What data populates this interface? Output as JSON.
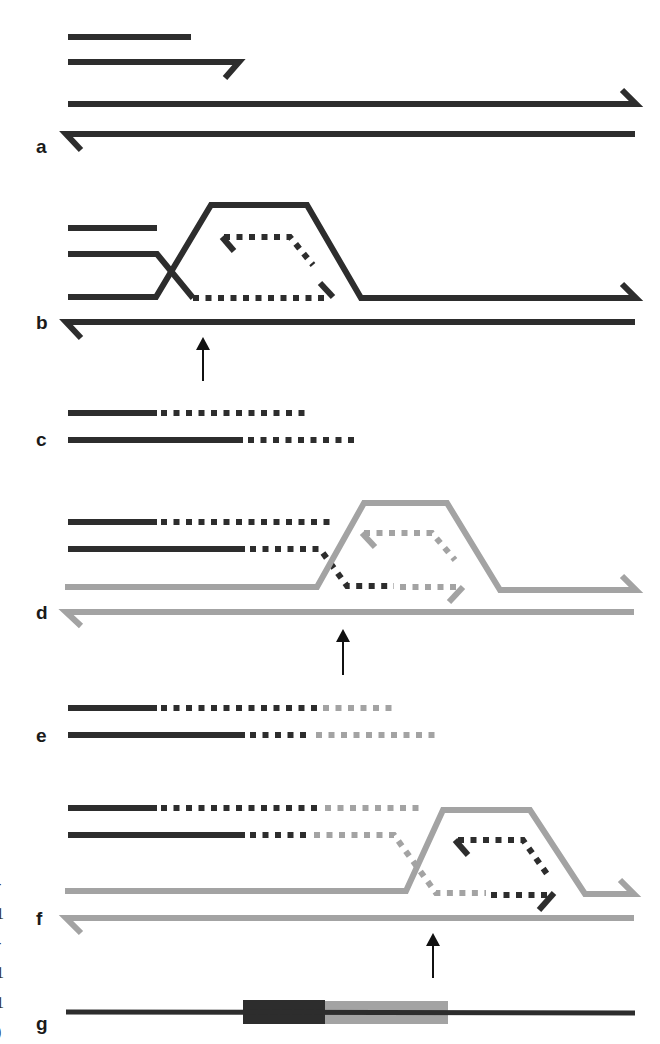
{
  "figure": {
    "colors": {
      "dark": "#2d2d2d",
      "grey": "#a3a3a3",
      "arrow": "#111111"
    },
    "stroke_width": 6,
    "dash": "6 6.5",
    "panels": [
      {
        "id": "a",
        "label": "a",
        "label_pos": [
          36,
          137
        ]
      },
      {
        "id": "b",
        "label": "b",
        "label_pos": [
          36,
          313
        ]
      },
      {
        "id": "c",
        "label": "c",
        "label_pos": [
          36,
          430
        ]
      },
      {
        "id": "d",
        "label": "d",
        "label_pos": [
          36,
          603
        ]
      },
      {
        "id": "e",
        "label": "e",
        "label_pos": [
          36,
          726
        ]
      },
      {
        "id": "f",
        "label": "f",
        "label_pos": [
          36,
          909
        ]
      },
      {
        "id": "g",
        "label": "g",
        "label_pos": [
          36,
          1014
        ]
      }
    ],
    "edge_glyphs": [
      {
        "text": "-",
        "y": 876
      },
      {
        "text": "1",
        "y": 906
      },
      {
        "text": "-",
        "y": 935
      },
      {
        "text": "1",
        "y": 965
      },
      {
        "text": "1",
        "y": 995
      },
      {
        "text": ")",
        "y": 1024
      }
    ],
    "paths": [
      {
        "panel": "a",
        "color": "dark",
        "dashed": false,
        "d": "M68 37 L191 37"
      },
      {
        "panel": "a",
        "color": "dark",
        "dashed": false,
        "d": "M68 62 L239 62 L225 78"
      },
      {
        "panel": "a",
        "color": "dark",
        "dashed": false,
        "d": "M68 104 L636 104 L622 90"
      },
      {
        "panel": "a",
        "color": "dark",
        "dashed": false,
        "d": "M635 134 L66 134 L81 150"
      },
      {
        "panel": "b",
        "color": "dark",
        "dashed": false,
        "d": "M68 228 L157 228"
      },
      {
        "panel": "b",
        "color": "dark",
        "dashed": false,
        "d": "M68 254 L157 254 L193 298"
      },
      {
        "panel": "b",
        "color": "dark",
        "dashed": false,
        "d": "M68 297 L156 297 L211 205 L307 205 L361 298 L636 298 L622 284"
      },
      {
        "panel": "b",
        "color": "dark",
        "dashed": false,
        "d": "M635 322 L66 322 L81 338"
      },
      {
        "panel": "b",
        "color": "dark",
        "dashed": true,
        "d": "M193 298 L330 298"
      },
      {
        "panel": "b",
        "color": "dark",
        "dashed": false,
        "d": "M320 283 L333 297"
      },
      {
        "panel": "b",
        "color": "dark",
        "dashed": true,
        "d": "M224 237 L290 237 L313 265"
      },
      {
        "panel": "b",
        "color": "dark",
        "dashed": false,
        "d": "M222 237 L234 251"
      },
      {
        "panel": "c",
        "color": "dark",
        "dashed": false,
        "d": "M68 413 L157 413"
      },
      {
        "panel": "c",
        "color": "dark",
        "dashed": true,
        "d": "M161 413 L306 413"
      },
      {
        "panel": "c",
        "color": "dark",
        "dashed": false,
        "d": "M68 440 L243 440"
      },
      {
        "panel": "c",
        "color": "dark",
        "dashed": true,
        "d": "M248 440 L356 440"
      },
      {
        "panel": "d",
        "color": "dark",
        "dashed": false,
        "d": "M68 522 L157 522"
      },
      {
        "panel": "d",
        "color": "dark",
        "dashed": true,
        "d": "M161 522 L331 522"
      },
      {
        "panel": "d",
        "color": "dark",
        "dashed": false,
        "d": "M68 549 L245 549"
      },
      {
        "panel": "d",
        "color": "dark",
        "dashed": true,
        "d": "M250 549 L320 549 L347 586 L394 586"
      },
      {
        "panel": "d",
        "color": "grey",
        "dashed": false,
        "d": "M65 587 L317 587 L364 503 L447 503 L500 590 L636 590 L622 576"
      },
      {
        "panel": "d",
        "color": "grey",
        "dashed": false,
        "d": "M634 612 L66 612 L81 626"
      },
      {
        "panel": "d",
        "color": "grey",
        "dashed": true,
        "d": "M400 587 L462 587"
      },
      {
        "panel": "d",
        "color": "grey",
        "dashed": false,
        "d": "M463 587 L449 602"
      },
      {
        "panel": "d",
        "color": "grey",
        "dashed": true,
        "d": "M364 533 L432 533 L455 560"
      },
      {
        "panel": "d",
        "color": "grey",
        "dashed": false,
        "d": "M362 533 L375 547"
      },
      {
        "panel": "e",
        "color": "dark",
        "dashed": false,
        "d": "M68 708 L157 708"
      },
      {
        "panel": "e",
        "color": "dark",
        "dashed": true,
        "d": "M161 708 L319 708"
      },
      {
        "panel": "e",
        "color": "grey",
        "dashed": true,
        "d": "M323 708 L394 708"
      },
      {
        "panel": "e",
        "color": "dark",
        "dashed": false,
        "d": "M68 735 L245 735"
      },
      {
        "panel": "e",
        "color": "dark",
        "dashed": true,
        "d": "M250 735 L310 735"
      },
      {
        "panel": "e",
        "color": "grey",
        "dashed": true,
        "d": "M316 735 L441 735"
      },
      {
        "panel": "f",
        "color": "dark",
        "dashed": false,
        "d": "M68 808 L157 808"
      },
      {
        "panel": "f",
        "color": "dark",
        "dashed": true,
        "d": "M161 808 L318 808"
      },
      {
        "panel": "f",
        "color": "grey",
        "dashed": true,
        "d": "M325 808 L421 808"
      },
      {
        "panel": "f",
        "color": "dark",
        "dashed": false,
        "d": "M68 835 L245 835"
      },
      {
        "panel": "f",
        "color": "dark",
        "dashed": true,
        "d": "M250 835 L311 835"
      },
      {
        "panel": "f",
        "color": "grey",
        "dashed": true,
        "d": "M314 835 L394 835 L436 893 L486 893"
      },
      {
        "panel": "f",
        "color": "grey",
        "dashed": false,
        "d": "M65 891 L406 891 L443 810 L530 810 L585 894 L634 894 L620 880"
      },
      {
        "panel": "f",
        "color": "grey",
        "dashed": false,
        "d": "M634 918 L66 918 L81 933"
      },
      {
        "panel": "f",
        "color": "dark",
        "dashed": true,
        "d": "M491 895 L551 895"
      },
      {
        "panel": "f",
        "color": "dark",
        "dashed": false,
        "d": "M554 893 L539 910"
      },
      {
        "panel": "f",
        "color": "dark",
        "dashed": true,
        "d": "M458 840 L523 840 L547 874"
      },
      {
        "panel": "f",
        "color": "dark",
        "dashed": false,
        "d": "M455 840 L468 855"
      },
      {
        "panel": "g",
        "color": "dark",
        "dashed": false,
        "thin": true,
        "d": "M66 1012 L635 1013"
      }
    ],
    "blocks": [
      {
        "panel": "g",
        "name": "dark-segment",
        "color": "dark",
        "x": 243,
        "y": 1000,
        "w": 82,
        "h": 24
      },
      {
        "panel": "g",
        "name": "grey-segment",
        "color": "grey",
        "x": 325,
        "y": 1001,
        "w": 123,
        "h": 23
      }
    ],
    "arrows": [
      {
        "panel": "b",
        "x": 203,
        "tip_y": 337,
        "tail_y": 381
      },
      {
        "panel": "d",
        "x": 343,
        "tip_y": 629,
        "tail_y": 675
      },
      {
        "panel": "f",
        "x": 433,
        "tip_y": 933,
        "tail_y": 978
      }
    ]
  }
}
